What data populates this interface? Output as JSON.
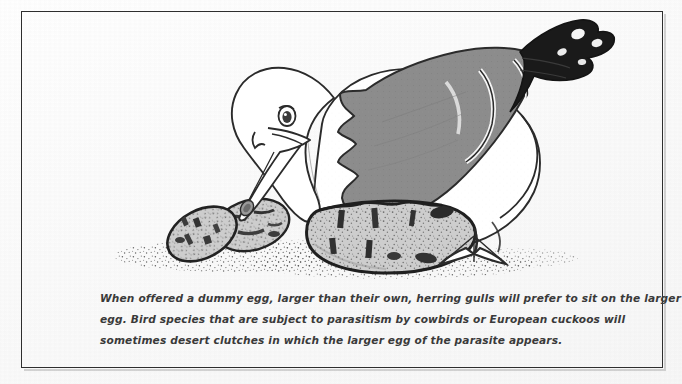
{
  "figure": {
    "frame_color": "#2e2e2e",
    "background_color": "#fdfdfd"
  },
  "illustration": {
    "alt": "Line drawing of a herring gull with a grey wing and black wingtip, head lowered, sitting on a large speckled egg, with two smaller speckled eggs on stippled ground to the left",
    "subject": "herring-gull",
    "colors": {
      "ink": "#2b2b2b",
      "wing_gray": "#8a8a8a",
      "wingtip_black": "#1a1a1a",
      "egg_fill": "#c9c9c9",
      "egg_speckle": "#4a4a4a",
      "body_white": "#ffffff",
      "ground_stipple": "#5a5a5a"
    },
    "elements": [
      {
        "name": "gull-head",
        "description": "white head with dark eye"
      },
      {
        "name": "gull-beak",
        "description": "long downward-pointing beak with red spot marking"
      },
      {
        "name": "gull-wing",
        "description": "grey folded wing"
      },
      {
        "name": "gull-wingtip",
        "description": "black wingtip with white mirror spots"
      },
      {
        "name": "large-egg",
        "description": "oversized speckled dummy egg beneath the gull"
      },
      {
        "name": "small-egg-left",
        "description": "smaller speckled egg"
      },
      {
        "name": "small-egg-right",
        "description": "smaller speckled egg"
      },
      {
        "name": "webbed-foot",
        "description": "webbed foot resting on the ground"
      },
      {
        "name": "ground",
        "description": "stippled sand/nest ground"
      }
    ]
  },
  "caption": {
    "full_text": "When offered a dummy egg, larger than their own, herring gulls will prefer to sit on the larger egg. Bird species that are subject to parasitism by cowbirds or European cuckoos will sometimes desert clutches in which the larger egg of the parasite appears.",
    "lines": [
      "When offered a dummy egg, larger than their own, herring gulls will prefer to sit on the larger",
      "egg. Bird species that are subject to parasitism by cowbirds or European cuckoos will",
      "sometimes desert clutches in which the larger egg of the parasite appears."
    ]
  }
}
